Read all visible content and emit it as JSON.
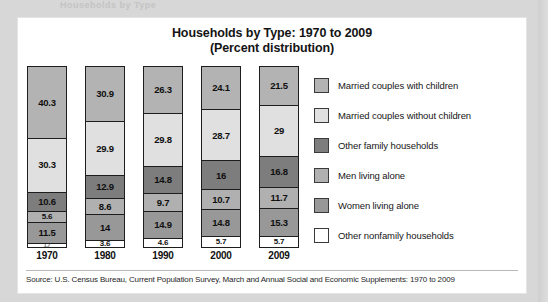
{
  "ghost_text": "Households by Type",
  "title": {
    "line1": "Households by Type: 1970 to 2009",
    "line2": "(Percent distribution)"
  },
  "source": "Source: U.S. Census Bureau, Current Population Survey, March and Annual Social and Economic Supplements: 1970 to 2009",
  "legend": {
    "items": [
      {
        "label": "Married couples with children",
        "color": "#b3b3b3"
      },
      {
        "label": "Married couples without children",
        "color": "#e0e0e0"
      },
      {
        "label": "Other family households",
        "color": "#7d7d7d"
      },
      {
        "label": "Men living alone",
        "color": "#b0b0b0"
      },
      {
        "label": "Women living alone",
        "color": "#989898"
      },
      {
        "label": "Other nonfamily households",
        "color": "#ffffff"
      }
    ]
  },
  "chart_data": {
    "type": "bar",
    "subtype": "stacked-100-percent",
    "title": "Households by Type: 1970 to 2009 (Percent distribution)",
    "xlabel": "",
    "ylabel": "Percent distribution",
    "ylim": [
      0,
      100
    ],
    "grid": false,
    "legend_position": "right",
    "orientation": "vertical",
    "stack_order_top_to_bottom": [
      "Married couples with children",
      "Married couples without children",
      "Other family households",
      "Men living alone",
      "Women living alone",
      "Other nonfamily households"
    ],
    "categories": [
      "1970",
      "1980",
      "1990",
      "2000",
      "2009"
    ],
    "series": [
      {
        "name": "Married couples with children",
        "color": "#b3b3b3",
        "values": [
          40.3,
          30.9,
          26.3,
          24.1,
          21.5
        ]
      },
      {
        "name": "Married couples without children",
        "color": "#e0e0e0",
        "values": [
          30.3,
          29.9,
          29.8,
          28.7,
          29
        ]
      },
      {
        "name": "Other family households",
        "color": "#7d7d7d",
        "values": [
          10.6,
          12.9,
          14.8,
          16,
          16.8
        ]
      },
      {
        "name": "Men living alone",
        "color": "#b0b0b0",
        "values": [
          5.6,
          8.6,
          9.7,
          10.7,
          11.7
        ]
      },
      {
        "name": "Women living alone",
        "color": "#989898",
        "values": [
          11.5,
          14,
          14.9,
          14.8,
          15.3
        ]
      },
      {
        "name": "Other nonfamily households",
        "color": "#ffffff",
        "values": [
          1.7,
          3.6,
          4.6,
          5.7,
          5.7
        ]
      }
    ],
    "bars": [
      {
        "category": "1970",
        "segments": [
          {
            "label": "40.3",
            "value": 40.3,
            "color": "#b3b3b3"
          },
          {
            "label": "30.3",
            "value": 30.3,
            "color": "#e0e0e0"
          },
          {
            "label": "10.6",
            "value": 10.6,
            "color": "#7d7d7d"
          },
          {
            "label": "5.6",
            "value": 5.6,
            "color": "#b0b0b0"
          },
          {
            "label": "11.5",
            "value": 11.5,
            "color": "#989898"
          },
          {
            "label": "1.7",
            "value": 1.7,
            "color": "#ffffff"
          }
        ]
      },
      {
        "category": "1980",
        "segments": [
          {
            "label": "30.9",
            "value": 30.9,
            "color": "#b3b3b3"
          },
          {
            "label": "29.9",
            "value": 29.9,
            "color": "#e0e0e0"
          },
          {
            "label": "12.9",
            "value": 12.9,
            "color": "#7d7d7d"
          },
          {
            "label": "8.6",
            "value": 8.6,
            "color": "#b0b0b0"
          },
          {
            "label": "14",
            "value": 14,
            "color": "#989898"
          },
          {
            "label": "3.6",
            "value": 3.6,
            "color": "#ffffff"
          }
        ]
      },
      {
        "category": "1990",
        "segments": [
          {
            "label": "26.3",
            "value": 26.3,
            "color": "#b3b3b3"
          },
          {
            "label": "29.8",
            "value": 29.8,
            "color": "#e0e0e0"
          },
          {
            "label": "14.8",
            "value": 14.8,
            "color": "#7d7d7d"
          },
          {
            "label": "9.7",
            "value": 9.7,
            "color": "#b0b0b0"
          },
          {
            "label": "14.9",
            "value": 14.9,
            "color": "#989898"
          },
          {
            "label": "4.6",
            "value": 4.6,
            "color": "#ffffff"
          }
        ]
      },
      {
        "category": "2000",
        "segments": [
          {
            "label": "24.1",
            "value": 24.1,
            "color": "#b3b3b3"
          },
          {
            "label": "28.7",
            "value": 28.7,
            "color": "#e0e0e0"
          },
          {
            "label": "16",
            "value": 16,
            "color": "#7d7d7d"
          },
          {
            "label": "10.7",
            "value": 10.7,
            "color": "#b0b0b0"
          },
          {
            "label": "14.8",
            "value": 14.8,
            "color": "#989898"
          },
          {
            "label": "5.7",
            "value": 5.7,
            "color": "#ffffff"
          }
        ]
      },
      {
        "category": "2009",
        "segments": [
          {
            "label": "21.5",
            "value": 21.5,
            "color": "#b3b3b3"
          },
          {
            "label": "29",
            "value": 29,
            "color": "#e0e0e0"
          },
          {
            "label": "16.8",
            "value": 16.8,
            "color": "#7d7d7d"
          },
          {
            "label": "11.7",
            "value": 11.7,
            "color": "#b0b0b0"
          },
          {
            "label": "15.3",
            "value": 15.3,
            "color": "#989898"
          },
          {
            "label": "5.7",
            "value": 5.7,
            "color": "#ffffff"
          }
        ]
      }
    ]
  }
}
